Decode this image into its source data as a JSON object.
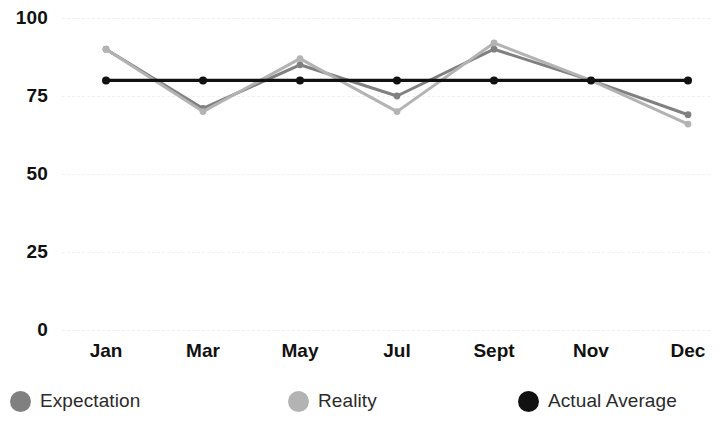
{
  "chart_data": {
    "type": "line",
    "title": "",
    "subtitle": "",
    "xlabel": "",
    "ylabel": "",
    "categories": [
      "Jan",
      "Mar",
      "May",
      "Jul",
      "Sept",
      "Nov",
      "Dec"
    ],
    "ylim": [
      0,
      100
    ],
    "yticks": [
      0,
      25,
      50,
      75,
      100
    ],
    "ytick_labels": [
      "0",
      "25",
      "50",
      "75",
      "100"
    ],
    "grid": true,
    "grid_axis": "y",
    "legend_position": "bottom",
    "series": [
      {
        "name": "Expectation",
        "color": "#808080",
        "values": [
          90,
          71,
          85,
          75,
          90,
          80,
          69
        ]
      },
      {
        "name": "Reality",
        "color": "#b3b3b3",
        "values": [
          90,
          70,
          87,
          70,
          92,
          80,
          66
        ]
      },
      {
        "name": "Actual Average",
        "color": "#111111",
        "values": [
          80,
          80,
          80,
          80,
          80,
          80,
          80
        ]
      }
    ]
  },
  "legend": {
    "items": [
      {
        "label": "Expectation",
        "color": "#808080"
      },
      {
        "label": "Reality",
        "color": "#b3b3b3"
      },
      {
        "label": "Actual Average",
        "color": "#111111"
      }
    ]
  },
  "colors": {
    "background": "#ffffff",
    "gridline": "#f0f0f0",
    "axis_text": "#111111",
    "legend_text": "#2b2b2b"
  }
}
